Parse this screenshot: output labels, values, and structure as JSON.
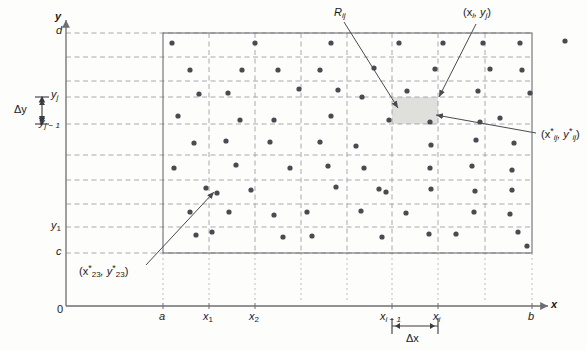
{
  "figure": {
    "type": "double-riemann-sum-partition-diagram",
    "axes": {
      "x_axis_label": "x",
      "y_axis_label": "y",
      "origin_label": "0",
      "x_ticks": [
        {
          "label": "a",
          "sub": "",
          "x": 163
        },
        {
          "label": "x",
          "sub": "1",
          "x": 209
        },
        {
          "label": "x",
          "sub": "2",
          "x": 255
        },
        {
          "label": "x",
          "sub": "i − 1",
          "x": 392
        },
        {
          "label": "x",
          "sub": "i",
          "x": 438
        },
        {
          "label": "b",
          "sub": "",
          "x": 532
        }
      ],
      "y_ticks": [
        {
          "label": "d",
          "sub": "",
          "y": 33
        },
        {
          "label": "y",
          "sub": "j",
          "y": 97
        },
        {
          "label": "y",
          "sub": "j − 1",
          "y": 124
        },
        {
          "label": "y",
          "sub": "1",
          "y": 227
        },
        {
          "label": "c",
          "sub": "",
          "y": 253
        }
      ]
    },
    "annotations": {
      "delta_x": {
        "label": "Δx",
        "x": 412,
        "y": 337
      },
      "delta_y": {
        "label": "Δy",
        "x": 20,
        "y": 110
      },
      "subrectangle": {
        "label": "R",
        "sub": "ij",
        "x": 337,
        "y": 12
      },
      "corner_point": {
        "label": "(x",
        "sub1": "i",
        "mid": ", y",
        "sub2": "j",
        "close": ")",
        "x": 466,
        "y": 12
      },
      "sample_point": {
        "label": "(x",
        "sub1": "ij",
        "mid": ", y",
        "sub2": "ij",
        "close": ")",
        "starred": true,
        "x": 542,
        "y": 134
      },
      "sample_point_23": {
        "label": "(x",
        "sub1": "23",
        "mid": ", y",
        "sub2": "23",
        "close": ")",
        "starred": true,
        "x": 82,
        "y": 272
      }
    },
    "plot_region": {
      "left": 163,
      "top": 33,
      "right": 532,
      "bottom": 253,
      "columns": 8,
      "rows": 9,
      "border_color": "#7a7a7a",
      "grid_color": "#9a9aa0",
      "grid_style": "dashed",
      "shaded_cell": {
        "col": 5,
        "row": 3,
        "fill": "#dededa"
      }
    },
    "colors": {
      "dot": "#4a4a52",
      "axis": "#6e6e72",
      "leader": "#4a4a50",
      "background": "#fdfdfc"
    },
    "dots": [
      [
        172,
        43
      ],
      [
        255,
        43
      ],
      [
        331,
        43
      ],
      [
        399,
        43
      ],
      [
        443,
        43
      ],
      [
        483,
        43
      ],
      [
        520,
        43
      ],
      [
        565,
        41
      ],
      [
        190,
        70
      ],
      [
        242,
        70
      ],
      [
        278,
        70
      ],
      [
        320,
        70
      ],
      [
        374,
        68
      ],
      [
        435,
        69
      ],
      [
        490,
        69
      ],
      [
        522,
        70
      ],
      [
        199,
        94
      ],
      [
        228,
        93
      ],
      [
        299,
        89
      ],
      [
        338,
        90
      ],
      [
        362,
        97
      ],
      [
        407,
        91
      ],
      [
        478,
        91
      ],
      [
        530,
        93
      ],
      [
        178,
        116
      ],
      [
        240,
        120
      ],
      [
        274,
        120
      ],
      [
        331,
        116
      ],
      [
        389,
        120
      ],
      [
        430,
        122
      ],
      [
        480,
        122
      ],
      [
        500,
        118
      ],
      [
        194,
        143
      ],
      [
        226,
        141
      ],
      [
        270,
        142
      ],
      [
        320,
        142
      ],
      [
        356,
        146
      ],
      [
        431,
        145
      ],
      [
        476,
        140
      ],
      [
        514,
        143
      ],
      [
        174,
        168
      ],
      [
        236,
        165
      ],
      [
        290,
        168
      ],
      [
        328,
        166
      ],
      [
        364,
        168
      ],
      [
        430,
        168
      ],
      [
        472,
        166
      ],
      [
        512,
        170
      ],
      [
        206,
        188
      ],
      [
        217,
        193
      ],
      [
        251,
        190
      ],
      [
        336,
        187
      ],
      [
        379,
        189
      ],
      [
        386,
        192
      ],
      [
        431,
        189
      ],
      [
        475,
        191
      ],
      [
        512,
        190
      ],
      [
        190,
        212
      ],
      [
        229,
        212
      ],
      [
        274,
        215
      ],
      [
        307,
        212
      ],
      [
        361,
        211
      ],
      [
        406,
        213
      ],
      [
        474,
        212
      ],
      [
        510,
        214
      ],
      [
        196,
        235
      ],
      [
        212,
        232
      ],
      [
        283,
        237
      ],
      [
        312,
        236
      ],
      [
        382,
        237
      ],
      [
        429,
        234
      ],
      [
        456,
        234
      ],
      [
        518,
        232
      ],
      [
        527,
        246
      ]
    ]
  }
}
